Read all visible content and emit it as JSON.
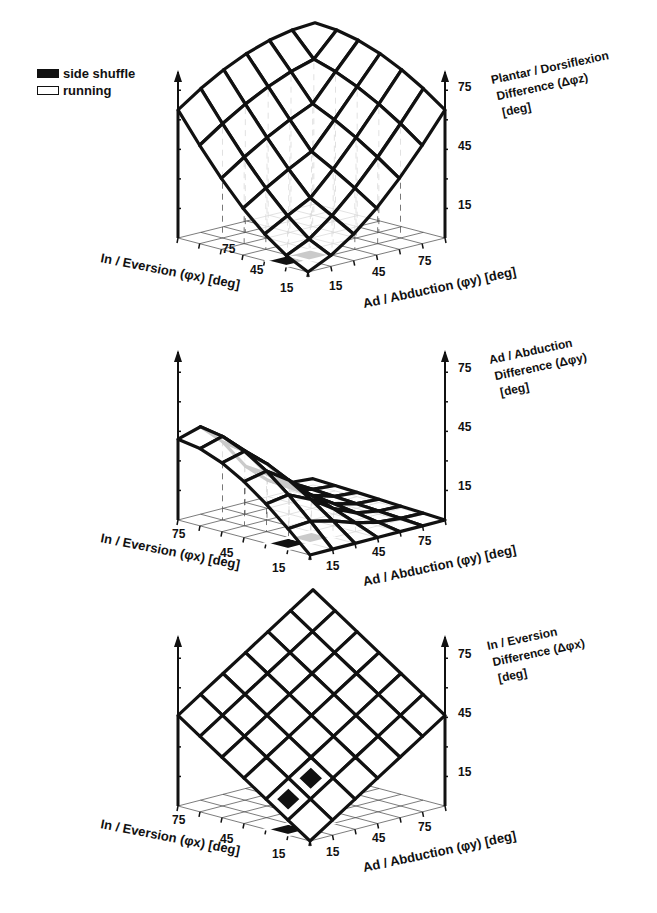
{
  "legend": {
    "items": [
      {
        "label": "side shuffle",
        "fill": "#111111"
      },
      {
        "label": "running",
        "fill": "#ffffff"
      }
    ]
  },
  "axis_common": {
    "x_label": "In / Eversion (φx) [deg]",
    "y_label": "Ad / Abduction (φy) [deg]",
    "x_ticks": [
      "75",
      "45",
      "15"
    ],
    "y_ticks": [
      "15",
      "45",
      "75"
    ],
    "z_ticks": [
      "75",
      "45",
      "15"
    ]
  },
  "panels": [
    {
      "z_label_line1": "Plantar / Dorsiflexion",
      "z_label_line2": "Difference (Δφz)",
      "z_label_line3": "[deg]"
    },
    {
      "z_label_line1": "Ad / Abduction",
      "z_label_line2": "Difference (Δφy)",
      "z_label_line3": "[deg]"
    },
    {
      "z_label_line1": "In / Eversion",
      "z_label_line2": "Difference (Δφx)",
      "z_label_line3": "[deg]"
    }
  ],
  "chart_data": [
    {
      "type": "surface3d",
      "title": "",
      "xlabel": "In / Eversion (φx) [deg]",
      "ylabel": "Ad / Abduction (φy) [deg]",
      "zlabel": "Plantar / Dorsiflexion Difference (Δφz) [deg]",
      "x_ticks": [
        15,
        45,
        75
      ],
      "y_ticks": [
        15,
        45,
        75
      ],
      "z_ticks": [
        15,
        45,
        75
      ],
      "zlim": [
        0,
        90
      ],
      "grid": "6x6 surface over phi_x, phi_y in [0,90]",
      "highlight_cells": [
        {
          "series": "side shuffle",
          "phi_x": [
            15,
            30
          ],
          "phi_y": [
            0,
            15
          ],
          "fill": "black"
        },
        {
          "series": "side shuffle",
          "phi_x": [
            15,
            30
          ],
          "phi_y": [
            15,
            30
          ],
          "fill": "black"
        }
      ],
      "description": "Difference grows with both phi_x and phi_y; max approx 90 deg at phi_x=90, phi_y=90 back corner; ~0 at origin"
    },
    {
      "type": "surface3d",
      "title": "",
      "xlabel": "In / Eversion (φx) [deg]",
      "ylabel": "Ad / Abduction (φy) [deg]",
      "zlabel": "Ad / Abduction Difference (Δφy) [deg]",
      "x_ticks": [
        15,
        45,
        75
      ],
      "y_ticks": [
        15,
        45,
        75
      ],
      "z_ticks": [
        15,
        45,
        75
      ],
      "zlim": [
        0,
        90
      ],
      "grid": "6x6 surface over phi_x, phi_y in [0,90]",
      "highlight_cells": [
        {
          "series": "side shuffle",
          "phi_x": [
            15,
            30
          ],
          "phi_y": [
            0,
            15
          ],
          "fill": "black"
        },
        {
          "series": "side shuffle",
          "phi_x": [
            15,
            30
          ],
          "phi_y": [
            15,
            30
          ],
          "fill": "black"
        }
      ],
      "description": "Peak approx 40 deg near phi_x=75-90, phi_y=15-30; falls to ~0 at high phi_y"
    },
    {
      "type": "surface3d",
      "title": "",
      "xlabel": "In / Eversion (φx) [deg]",
      "ylabel": "Ad / Abduction (φy) [deg]",
      "zlabel": "In / Eversion Difference (Δφx) [deg]",
      "x_ticks": [
        15,
        45,
        75
      ],
      "y_ticks": [
        15,
        45,
        75
      ],
      "z_ticks": [
        15,
        45,
        75
      ],
      "zlim": [
        0,
        90
      ],
      "grid": "6x6 planar surface over phi_x, phi_y in [0,90]",
      "highlight_cells": [
        {
          "series": "side shuffle",
          "phi_x": [
            15,
            30
          ],
          "phi_y": [
            0,
            15
          ],
          "fill": "black"
        },
        {
          "series": "side shuffle",
          "phi_x": [
            15,
            30
          ],
          "phi_y": [
            15,
            30
          ],
          "fill": "black"
        }
      ],
      "description": "Planar pyramid: difference increases linearly with both angles, peak ~90+ deg at back corner"
    }
  ]
}
